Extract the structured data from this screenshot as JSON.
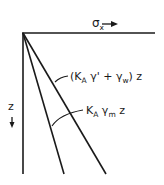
{
  "diagram": {
    "type": "pressure-distribution",
    "axes": {
      "horizontal": {
        "symbol": "σ",
        "subscript": "x",
        "arrow": "→"
      },
      "vertical": {
        "symbol": "z",
        "arrow": "↓"
      }
    },
    "lines": [
      {
        "id": "outer",
        "label_parts": {
          "open": "(K",
          "sub1": "A",
          "mid": " γ' + γ",
          "sub2": "w",
          "close": ") z"
        },
        "label_text": "(K_A γ' + γ_w) z"
      },
      {
        "id": "inner",
        "label_parts": {
          "k": "K",
          "sub1": "A",
          "g": " γ",
          "sub2": "m",
          "z": " z"
        },
        "label_text": "K_A γ_m z"
      }
    ],
    "colors": {
      "ink": "#1a1a1a",
      "background": "#ffffff"
    }
  }
}
